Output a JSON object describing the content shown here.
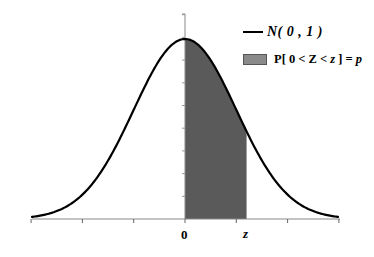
{
  "chart_data": {
    "type": "area",
    "title": "",
    "xlabel": "",
    "ylabel": "",
    "xlim": [
      -3,
      3
    ],
    "ylim": [
      0,
      0.42
    ],
    "grid": false,
    "x_tick_count": 7,
    "x_tick_labels": [
      {
        "value": 0,
        "label": "0"
      },
      {
        "value": 1.2,
        "label": "z"
      }
    ],
    "series": [
      {
        "name": "N(0,1)",
        "kind": "line",
        "function": "standard_normal_pdf",
        "mean": 0,
        "sd": 1,
        "color": "#000000",
        "x": [
          -3,
          -2.5,
          -2,
          -1.5,
          -1,
          -0.5,
          0,
          0.5,
          1,
          1.5,
          2,
          2.5,
          3
        ],
        "y": [
          0.0044,
          0.0175,
          0.054,
          0.1295,
          0.242,
          0.3521,
          0.3989,
          0.3521,
          0.242,
          0.1295,
          0.054,
          0.0175,
          0.0044
        ]
      },
      {
        "name": "P[0<Z<z]=p",
        "kind": "shaded_area",
        "from": 0,
        "to": 1.2,
        "color": "#5a5a5a"
      }
    ],
    "legend_position": "top-right"
  },
  "legend": {
    "items": [
      {
        "label": "N(0,1)",
        "display": "N( 0 , 1 )",
        "symbol": "line",
        "color": "#000000"
      },
      {
        "label": "P[0<Z<z]=p",
        "display": "P[ 0 < Z < z ] = p",
        "symbol": "box",
        "color": "#8a8a8a"
      }
    ]
  },
  "axis": {
    "x_label_zero": "0",
    "x_label_z": "z"
  }
}
